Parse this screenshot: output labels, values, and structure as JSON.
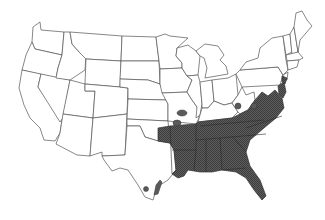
{
  "map": {
    "type": "species-range-map",
    "region": "Contiguous United States",
    "legend": [],
    "title": "",
    "colors": {
      "background": "#ffffff",
      "state_border": "#555555",
      "range_fill": "#555555",
      "range_hatch": "#3a3a3a"
    },
    "range_states": [
      "Texas (east)",
      "Oklahoma (southeast)",
      "Arkansas",
      "Louisiana",
      "Mississippi",
      "Alabama",
      "Georgia",
      "Florida",
      "South Carolina",
      "North Carolina",
      "Tennessee",
      "Kentucky (south)",
      "Virginia",
      "Maryland",
      "Delaware",
      "New Jersey (south)"
    ],
    "isolated_populations": [
      "Missouri / Oklahoma (2 spots)",
      "Southern Indiana",
      "Southern Ohio",
      "South Texas (Gulf coast, 2 spots)"
    ]
  }
}
